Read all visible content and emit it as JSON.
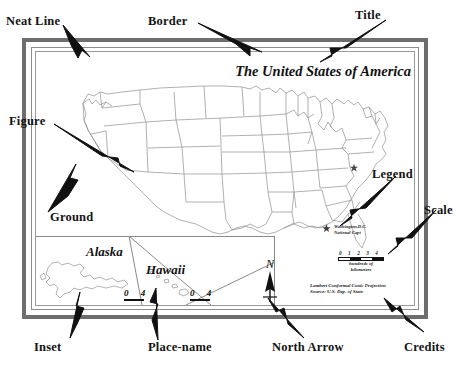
{
  "diagram": {
    "annotations": [
      {
        "key": "neat_line",
        "label": "Neat Line"
      },
      {
        "key": "border",
        "label": "Border"
      },
      {
        "key": "title",
        "label": "Title"
      },
      {
        "key": "figure",
        "label": "Figure"
      },
      {
        "key": "ground",
        "label": "Ground"
      },
      {
        "key": "legend",
        "label": "Legend"
      },
      {
        "key": "scale",
        "label": "Scale"
      },
      {
        "key": "inset",
        "label": "Inset"
      },
      {
        "key": "place_name",
        "label": "Place-name"
      },
      {
        "key": "north_arrow",
        "label": "North Arrow"
      },
      {
        "key": "credits",
        "label": "Credits"
      }
    ]
  },
  "map": {
    "title": "The United States of America",
    "legend": {
      "symbol": "star",
      "line1": "Washington,D.C.",
      "line2": "National Capt"
    },
    "scale": {
      "ticks": "0 1 2 3 4",
      "caption_line1": "hundreds of",
      "caption_line2": "kilometers"
    },
    "credits": {
      "line1": "Lambert Conformal Conic Projection",
      "line2": "Source: U.S. Dep. of State"
    },
    "north_arrow": {
      "letter": "N"
    },
    "insets": [
      {
        "name": "Alaska",
        "scale_ticks": "0 4"
      },
      {
        "name": "Hawaii",
        "scale_ticks": "0 4"
      }
    ]
  },
  "colors": {
    "border_gray": "#6e6e6e",
    "neatline_gray": "#8d8d8d",
    "ink": "#111111",
    "coastline": "#8c8c8c",
    "paper": "#ffffff"
  }
}
